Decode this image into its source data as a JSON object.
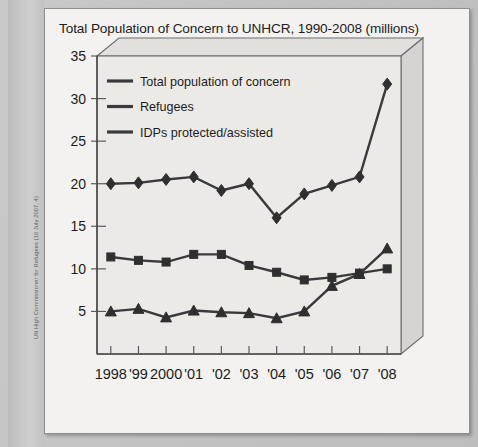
{
  "source_caption": "UN High Commissioner for Refugees (16 July 2007, 4)",
  "chart_data": {
    "type": "line",
    "title": "Total Population of Concern to UNHCR, 1990-2008 (millions)",
    "xlabel": "",
    "ylabel": "",
    "ylim": [
      0,
      35
    ],
    "yticks": [
      5,
      10,
      15,
      20,
      25,
      30,
      35
    ],
    "ytick_labels": [
      "5",
      "10",
      "15",
      "20",
      "25",
      "30",
      "35"
    ],
    "grid": false,
    "legend_position": "top-left",
    "categories": [
      "1998",
      "'99",
      "2000",
      "'01",
      "'02",
      "'03",
      "'04",
      "'05",
      "'06",
      "'07",
      "'08"
    ],
    "series": [
      {
        "name": "Total population of concern",
        "marker": "diamond",
        "color": "#3a3a3a",
        "values": [
          20.0,
          20.1,
          20.5,
          20.8,
          19.2,
          20.0,
          16.0,
          18.8,
          19.8,
          20.8,
          31.7
        ]
      },
      {
        "name": "Refugees",
        "marker": "square",
        "color": "#3a3a3a",
        "values": [
          11.4,
          11.0,
          10.8,
          11.7,
          11.7,
          10.4,
          9.6,
          8.7,
          9.0,
          9.5,
          10.0
        ]
      },
      {
        "name": "IDPs protected/assisted",
        "marker": "triangle",
        "color": "#3a3a3a",
        "values": [
          5.0,
          5.3,
          4.3,
          5.1,
          4.9,
          4.8,
          4.2,
          5.0,
          8.0,
          9.4,
          12.4
        ]
      }
    ]
  }
}
